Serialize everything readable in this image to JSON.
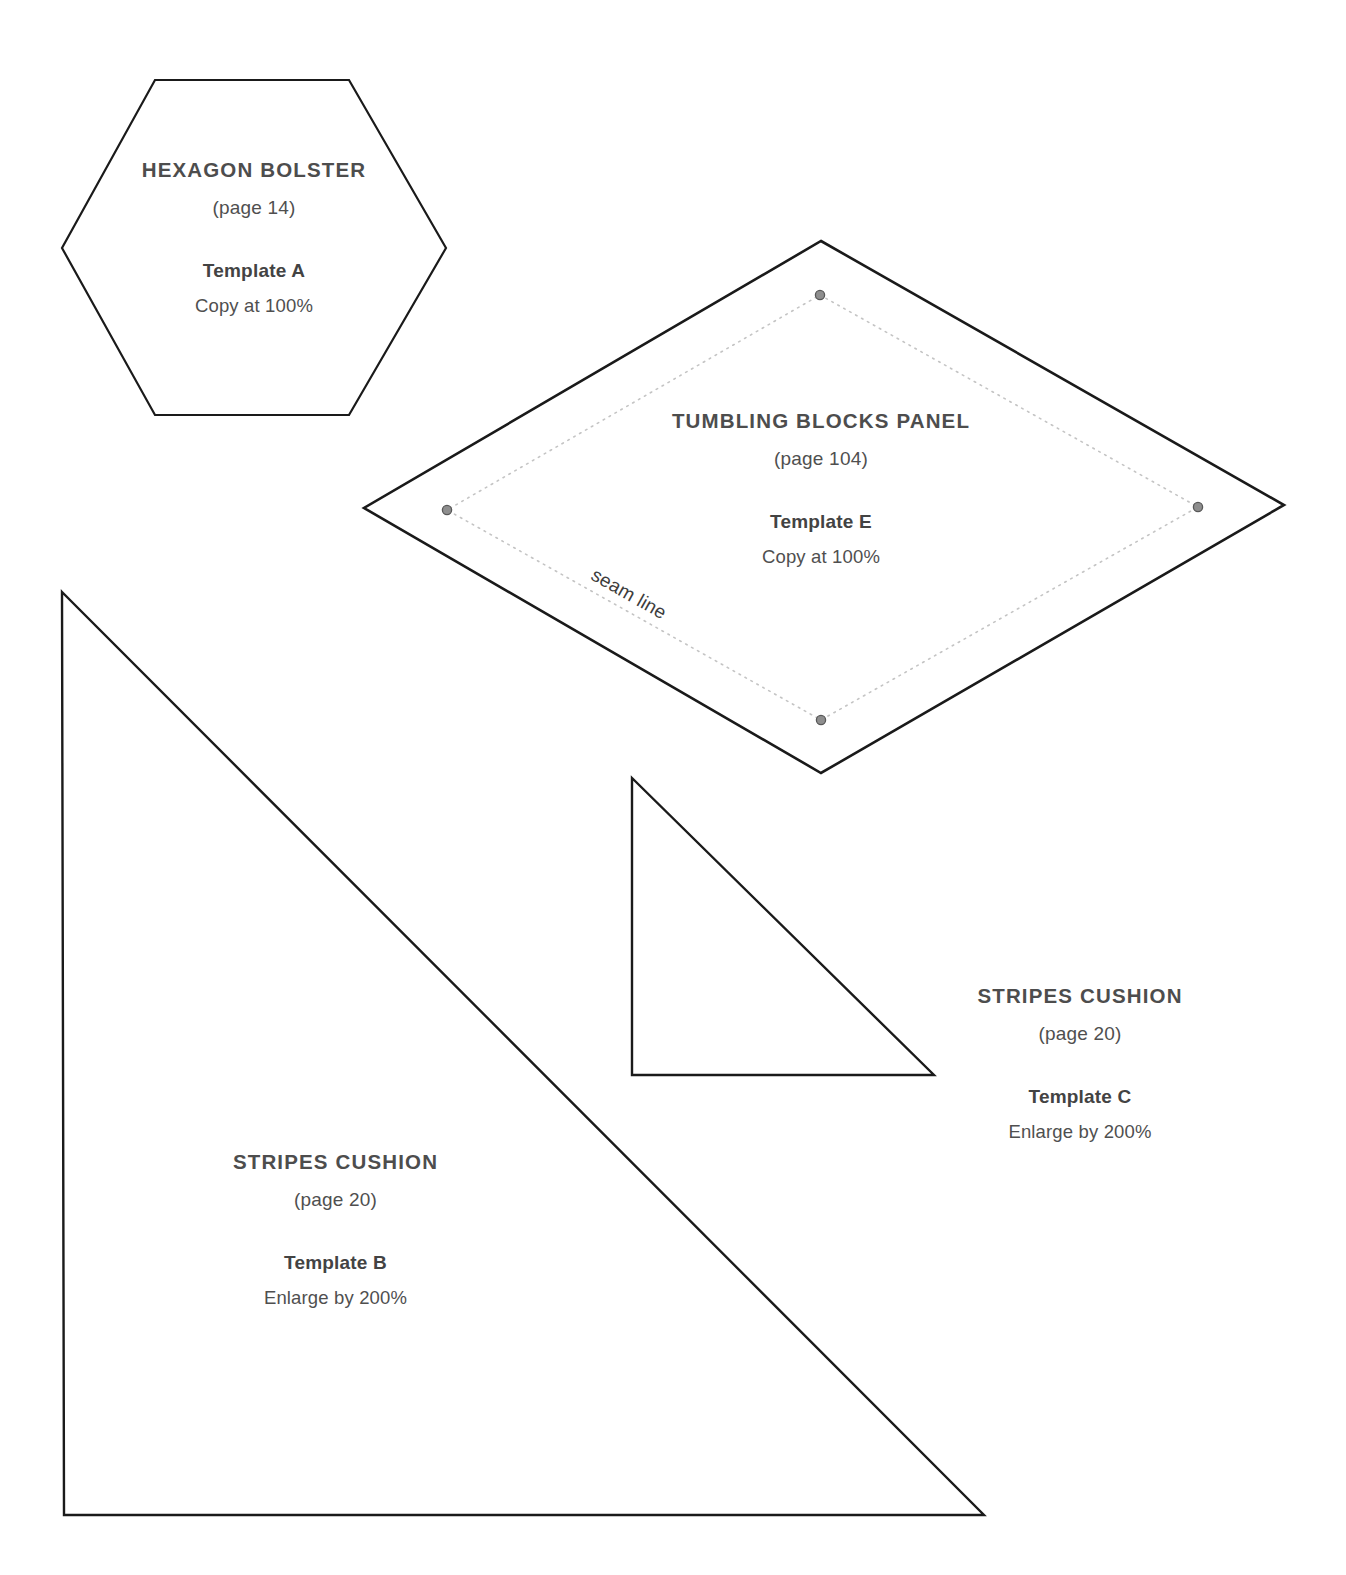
{
  "page": {
    "background_color": "#ffffff",
    "outline_color": "#1a1a1a",
    "seam_line_color": "#c9c9c9",
    "seam_dot_fill": "#8e8e8e",
    "seam_dot_stroke": "#5a5a5a",
    "title_color": "#4d4d4d",
    "body_color": "#4f4f4f"
  },
  "templates": [
    {
      "id": "template-a",
      "shape": "hexagon",
      "title": "HEXAGON BOLSTER",
      "page_ref": "(page 14)",
      "template_label": "Template A",
      "scale_note": "Copy at 100%"
    },
    {
      "id": "template-e",
      "shape": "diamond",
      "title": "TUMBLING BLOCKS PANEL",
      "page_ref": "(page 104)",
      "template_label": "Template E",
      "scale_note": "Copy at 100%",
      "seam_line_label": "seam line"
    },
    {
      "id": "template-c",
      "shape": "right-triangle",
      "title": "STRIPES CUSHION",
      "page_ref": "(page 20)",
      "template_label": "Template C",
      "scale_note": "Enlarge by 200%"
    },
    {
      "id": "template-b",
      "shape": "right-triangle",
      "title": "STRIPES CUSHION",
      "page_ref": "(page 20)",
      "template_label": "Template B",
      "scale_note": "Enlarge by 200%"
    }
  ]
}
